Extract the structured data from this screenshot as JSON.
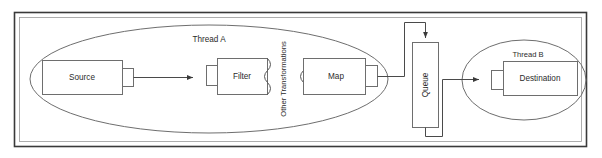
{
  "diagram": {
    "frame": {
      "label": "diagram-frame"
    },
    "groups": [
      {
        "id": "thread-a",
        "label": "Thread A"
      },
      {
        "id": "thread-b",
        "label": "Thread B"
      }
    ],
    "nodes": [
      {
        "id": "source",
        "label": "Source"
      },
      {
        "id": "filter",
        "label": "Filter"
      },
      {
        "id": "map",
        "label": "Map"
      },
      {
        "id": "queue",
        "label": "Queue"
      },
      {
        "id": "destination",
        "label": "Destination"
      }
    ],
    "annotations": [
      {
        "id": "other-transformations",
        "label": "Other Transformations"
      }
    ],
    "colors": {
      "background": "#ffffff",
      "frame_outer": "#3a3a3a",
      "frame_inner": "#9a9a9a",
      "box_stroke": "#6e6e6e",
      "connector": "#4a4a4a",
      "text": "#2b2b2b"
    }
  }
}
